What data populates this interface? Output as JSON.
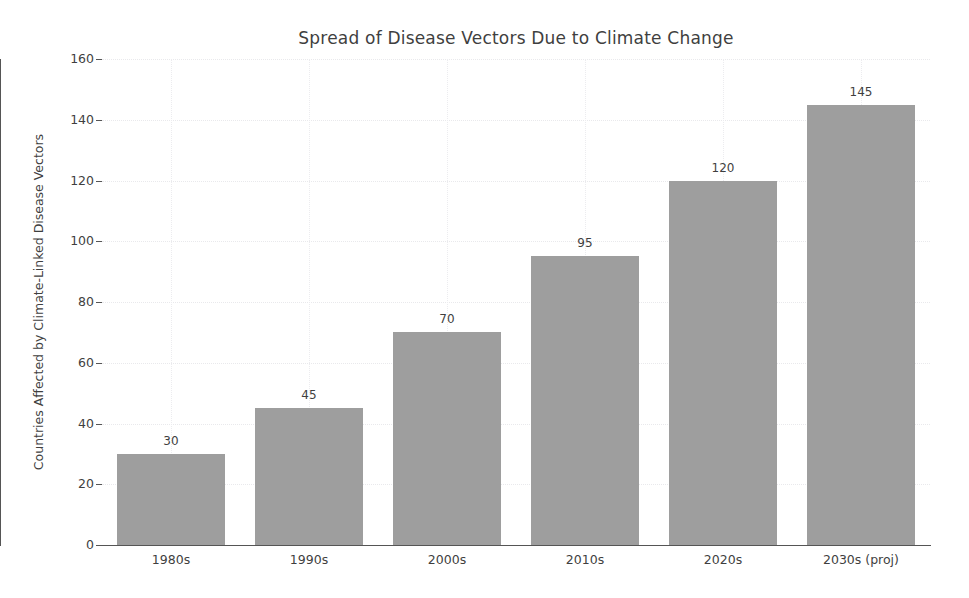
{
  "chart_data": {
    "type": "bar",
    "title": "Spread of Disease Vectors Due to Climate Change",
    "xlabel": "",
    "ylabel": "Countries Affected by Climate-Linked Disease Vectors",
    "categories": [
      "1980s",
      "1990s",
      "2000s",
      "2010s",
      "2020s",
      "2030s (proj)"
    ],
    "values": [
      30,
      45,
      70,
      95,
      120,
      145
    ],
    "value_labels": [
      "30",
      "45",
      "70",
      "95",
      "120",
      "145"
    ],
    "ylim": [
      0,
      160
    ],
    "yticks": [
      0,
      20,
      40,
      60,
      80,
      100,
      120,
      140,
      160
    ],
    "ytick_labels": [
      "0",
      "20",
      "40",
      "60",
      "80",
      "100",
      "120",
      "140",
      "160"
    ],
    "grid": true,
    "grid_style": "dotted",
    "legend": null,
    "bar_color": "#9e9e9e",
    "text_color": "#3f3f3f",
    "axis_color": "#555555",
    "grid_color": "#ececef",
    "background": "#ffffff"
  }
}
